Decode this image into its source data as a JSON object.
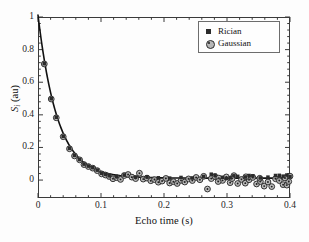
{
  "chart_data": {
    "type": "scatter",
    "title": "",
    "xlabel": "Echo time (s)",
    "ylabel": "S_i (au)",
    "ylabel_main": "S",
    "ylabel_sub": "i",
    "ylabel_unit": " (au)",
    "xlim": [
      0,
      0.4
    ],
    "ylim": [
      -0.11,
      1.0
    ],
    "xticks": [
      0,
      0.1,
      0.2,
      0.3,
      0.4
    ],
    "xticklabels": [
      "0",
      "0.1",
      "0.2",
      "0.3",
      "0.4"
    ],
    "yticks": [
      0,
      0.2,
      0.4,
      0.6,
      0.8,
      1
    ],
    "yticklabels": [
      "0",
      "0.2",
      "0.4",
      "0.6",
      "0.8",
      "1"
    ],
    "minor_ticks_per_interval": 4,
    "grid": false,
    "legend_position": "upper right",
    "legend": [
      {
        "name": "Rician",
        "marker": "filled-square",
        "color": "#2b2b2b"
      },
      {
        "name": "Gaussian",
        "marker": "dotted-circle",
        "color": "#2b2b2b"
      }
    ],
    "fit_curve": {
      "name": "mono-exponential fit",
      "color": "#111111",
      "linewidth": 1.6,
      "model": "S(t) = A*exp(-t/T2) + C",
      "A": 1.0,
      "T2": 0.031,
      "C": 0.012,
      "x": [
        0.0,
        0.004,
        0.008,
        0.012,
        0.016,
        0.02,
        0.024,
        0.028,
        0.032,
        0.036,
        0.04,
        0.048,
        0.056,
        0.064,
        0.072,
        0.08,
        0.09,
        0.1,
        0.11,
        0.12,
        0.14,
        0.16,
        0.18,
        0.2,
        0.24,
        0.28,
        0.32,
        0.36,
        0.4
      ],
      "y": [
        1.0,
        0.891,
        0.789,
        0.697,
        0.614,
        0.539,
        0.474,
        0.415,
        0.363,
        0.318,
        0.278,
        0.213,
        0.165,
        0.128,
        0.101,
        0.081,
        0.064,
        0.052,
        0.043,
        0.036,
        0.027,
        0.022,
        0.018,
        0.016,
        0.014,
        0.013,
        0.012,
        0.012,
        0.012
      ]
    },
    "series": [
      {
        "name": "Gaussian",
        "marker": "dotted-circle",
        "color": "#2b2b2b",
        "fill": "#b0b0b0",
        "points": [
          [
            0.01,
            0.712
          ],
          [
            0.021,
            0.497
          ],
          [
            0.029,
            0.382
          ],
          [
            0.04,
            0.266
          ],
          [
            0.05,
            0.192
          ],
          [
            0.058,
            0.148
          ],
          [
            0.066,
            0.124
          ],
          [
            0.073,
            0.095
          ],
          [
            0.08,
            0.083
          ],
          [
            0.087,
            0.073
          ],
          [
            0.094,
            0.058
          ],
          [
            0.101,
            0.038
          ],
          [
            0.107,
            0.031
          ],
          [
            0.113,
            0.022
          ],
          [
            0.119,
            0.008
          ],
          [
            0.125,
            0.015
          ],
          [
            0.131,
            0.004
          ],
          [
            0.137,
            0.028
          ],
          [
            0.143,
            0.034
          ],
          [
            0.149,
            0.018
          ],
          [
            0.155,
            0.009
          ],
          [
            0.161,
            0.042
          ],
          [
            0.167,
            0.006
          ],
          [
            0.173,
            0.012
          ],
          [
            0.179,
            -0.004
          ],
          [
            0.185,
            0.003
          ],
          [
            0.191,
            -0.013
          ],
          [
            0.197,
            -0.006
          ],
          [
            0.203,
            0.01
          ],
          [
            0.209,
            -0.018
          ],
          [
            0.215,
            -0.01
          ],
          [
            0.221,
            -0.021
          ],
          [
            0.227,
            -0.002
          ],
          [
            0.233,
            -0.012
          ],
          [
            0.239,
            0.007
          ],
          [
            0.245,
            -0.003
          ],
          [
            0.251,
            0.016
          ],
          [
            0.257,
            0.002
          ],
          [
            0.263,
            0.023
          ],
          [
            0.269,
            -0.055
          ],
          [
            0.275,
            0.009
          ],
          [
            0.281,
            0.021
          ],
          [
            0.287,
            0.012
          ],
          [
            0.293,
            -0.002
          ],
          [
            0.299,
            0.019
          ],
          [
            0.305,
            -0.016
          ],
          [
            0.311,
            0.027
          ],
          [
            0.317,
            -0.021
          ],
          [
            0.323,
            0.004
          ],
          [
            0.329,
            -0.019
          ],
          [
            0.335,
            0.002
          ],
          [
            0.341,
            0.016
          ],
          [
            0.347,
            -0.024
          ],
          [
            0.353,
            -0.009
          ],
          [
            0.359,
            -0.037
          ],
          [
            0.365,
            -0.012
          ],
          [
            0.371,
            -0.04
          ],
          [
            0.377,
            0.008
          ],
          [
            0.383,
            -0.003
          ],
          [
            0.389,
            -0.028
          ],
          [
            0.395,
            -0.031
          ],
          [
            0.4,
            0.024
          ],
          [
            0.352,
            0.011
          ],
          [
            0.33,
            0.02
          ],
          [
            0.308,
            0.009
          ],
          [
            0.286,
            -0.009
          ],
          [
            0.398,
            -0.009
          ],
          [
            0.392,
            0.013
          ]
        ]
      },
      {
        "name": "Rician",
        "marker": "filled-square",
        "color": "#2b2b2b",
        "points": [
          [
            0.01,
            0.714
          ],
          [
            0.021,
            0.499
          ],
          [
            0.029,
            0.385
          ],
          [
            0.04,
            0.268
          ],
          [
            0.05,
            0.195
          ],
          [
            0.058,
            0.151
          ],
          [
            0.066,
            0.126
          ],
          [
            0.073,
            0.098
          ],
          [
            0.08,
            0.086
          ],
          [
            0.087,
            0.076
          ],
          [
            0.094,
            0.061
          ],
          [
            0.101,
            0.042
          ],
          [
            0.107,
            0.035
          ],
          [
            0.113,
            0.027
          ],
          [
            0.125,
            0.021
          ],
          [
            0.137,
            0.031
          ],
          [
            0.155,
            0.018
          ],
          [
            0.173,
            0.02
          ],
          [
            0.191,
            0.014
          ],
          [
            0.209,
            0.012
          ],
          [
            0.227,
            0.016
          ],
          [
            0.245,
            0.013
          ],
          [
            0.263,
            0.022
          ],
          [
            0.275,
            0.036
          ],
          [
            0.281,
            0.03
          ],
          [
            0.293,
            0.017
          ],
          [
            0.305,
            0.014
          ],
          [
            0.317,
            0.023
          ],
          [
            0.329,
            0.019
          ],
          [
            0.341,
            0.026
          ],
          [
            0.353,
            0.013
          ],
          [
            0.365,
            0.018
          ],
          [
            0.377,
            0.028
          ],
          [
            0.383,
            0.029
          ],
          [
            0.389,
            0.024
          ],
          [
            0.395,
            0.031
          ],
          [
            0.4,
            0.021
          ],
          [
            0.335,
            0.028
          ],
          [
            0.311,
            0.026
          ],
          [
            0.299,
            0.01
          ]
        ]
      }
    ]
  }
}
